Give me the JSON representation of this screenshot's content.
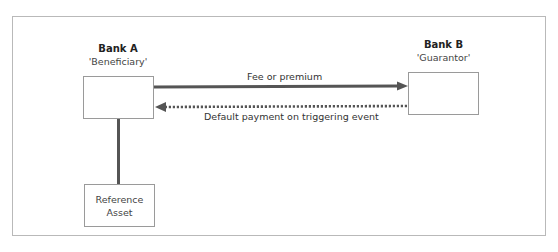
{
  "diagram": {
    "type": "credit-default-swap-flow",
    "nodes": {
      "bank_a": {
        "title": "Bank A",
        "role": "'Beneficiary'"
      },
      "bank_b": {
        "title": "Bank B",
        "role": "'Guarantor'"
      },
      "reference": {
        "line1": "Reference",
        "line2": "Asset"
      }
    },
    "edges": {
      "fee": {
        "label": "Fee or premium",
        "from": "Bank A",
        "to": "Bank B",
        "style": "solid"
      },
      "default": {
        "label": "Default payment on triggering event",
        "from": "Bank B",
        "to": "Bank A",
        "style": "dotted"
      },
      "reference_link": {
        "from": "Bank A",
        "to": "Reference Asset",
        "style": "solid"
      }
    },
    "colors": {
      "line": "#555555",
      "box_border": "#9a9a9a",
      "frame": "#b9b9b9"
    }
  }
}
